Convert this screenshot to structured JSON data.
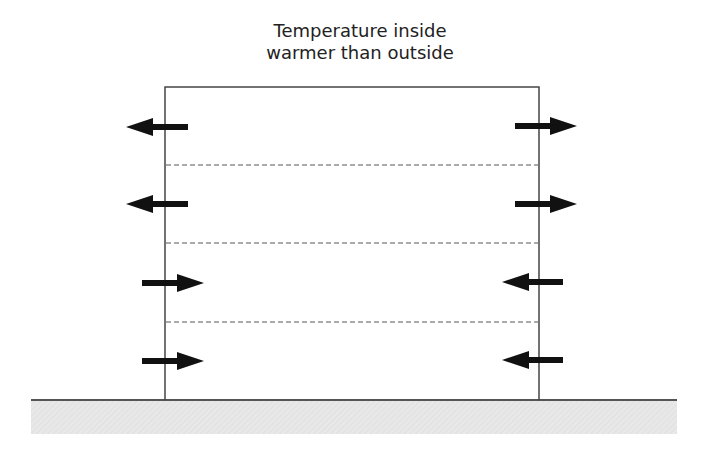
{
  "title": {
    "line1": "Temperature inside",
    "line2": "warmer than outside"
  },
  "diagram": {
    "building": {
      "x": 165,
      "y": 87,
      "width": 374,
      "height": 313,
      "stroke": "#444444"
    },
    "floor_dividers_y": [
      165,
      243,
      322
    ],
    "ground": {
      "x": 31,
      "y": 400,
      "width": 646,
      "height": 34,
      "fill": "#e6e6e6",
      "edge": "#555555"
    },
    "arrows": [
      {
        "side": "left",
        "level": 1,
        "direction": "out",
        "y": 127
      },
      {
        "side": "right",
        "level": 1,
        "direction": "out",
        "y": 126
      },
      {
        "side": "left",
        "level": 2,
        "direction": "out",
        "y": 204
      },
      {
        "side": "right",
        "level": 2,
        "direction": "out",
        "y": 204
      },
      {
        "side": "left",
        "level": 3,
        "direction": "in",
        "y": 283
      },
      {
        "side": "right",
        "level": 3,
        "direction": "in",
        "y": 282
      },
      {
        "side": "left",
        "level": 4,
        "direction": "in",
        "y": 361
      },
      {
        "side": "right",
        "level": 4,
        "direction": "in",
        "y": 360
      }
    ],
    "arrow_color": "#111111"
  }
}
